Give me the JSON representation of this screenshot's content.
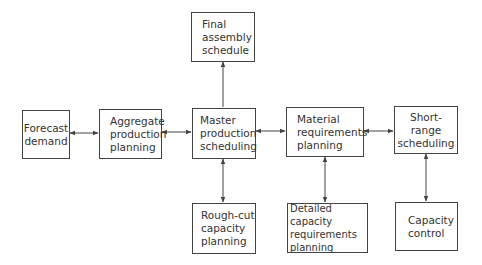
{
  "diagram": {
    "type": "flowchart",
    "title": "",
    "nodes": [
      {
        "id": "forecast",
        "label": "Forecast\ndemand"
      },
      {
        "id": "aggregate",
        "label": "Aggregate\nproduction\nplanning"
      },
      {
        "id": "mps",
        "label": "Master\nproduction\nscheduling"
      },
      {
        "id": "mrp",
        "label": "Material\nrequirements\nplanning"
      },
      {
        "id": "shortrange",
        "label": "Short-range\nscheduling"
      },
      {
        "id": "fas",
        "label": "Final\nassembly\nschedule"
      },
      {
        "id": "roughcut",
        "label": "Rough-cut\ncapacity\nplanning"
      },
      {
        "id": "crp",
        "label": "Detailed capacity\nrequirements\nplanning"
      },
      {
        "id": "capcontrol",
        "label": "Capacity\ncontrol"
      }
    ],
    "edges": [
      {
        "from": "forecast",
        "to": "aggregate",
        "direction": "both"
      },
      {
        "from": "aggregate",
        "to": "mps",
        "direction": "both"
      },
      {
        "from": "mps",
        "to": "mrp",
        "direction": "both"
      },
      {
        "from": "mrp",
        "to": "shortrange",
        "direction": "both"
      },
      {
        "from": "mps",
        "to": "fas",
        "direction": "forward"
      },
      {
        "from": "mps",
        "to": "roughcut",
        "direction": "both"
      },
      {
        "from": "mrp",
        "to": "crp",
        "direction": "both"
      },
      {
        "from": "shortrange",
        "to": "capcontrol",
        "direction": "both"
      }
    ]
  },
  "colors": {
    "line": "#444444",
    "text": "#333333",
    "background": "#ffffff"
  }
}
